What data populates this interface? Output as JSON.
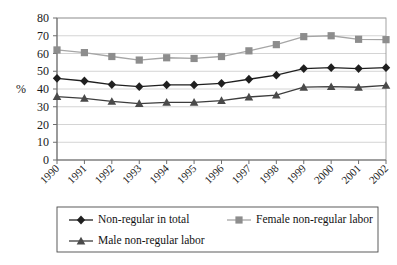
{
  "chart_data": {
    "type": "line",
    "title": "",
    "xlabel": "",
    "ylabel": "%",
    "categories": [
      "1990",
      "1991",
      "1992",
      "1993",
      "1994",
      "1995",
      "1996",
      "1997",
      "1998",
      "1999",
      "2000",
      "2001",
      "2002"
    ],
    "ylim": [
      0,
      80
    ],
    "ytick_step": 10,
    "yticks": [
      0,
      10,
      20,
      30,
      40,
      50,
      60,
      70,
      80
    ],
    "grid": true,
    "legend_position": "bottom",
    "series": [
      {
        "name": "Non-regular in total",
        "marker": "diamond",
        "color": "#1f1f1f",
        "line_color": "#1f1f1f",
        "values": [
          46.0,
          44.5,
          42.5,
          41.3,
          42.3,
          42.3,
          43.2,
          45.5,
          47.8,
          51.5,
          52.0,
          51.5,
          52.0
        ]
      },
      {
        "name": "Female non-regular labor",
        "marker": "square",
        "color": "#8d8d8d",
        "line_color": "#a6a6a6",
        "values": [
          62.0,
          60.5,
          58.3,
          56.3,
          57.6,
          57.2,
          58.3,
          61.5,
          65.0,
          69.5,
          70.0,
          68.0,
          67.8
        ]
      },
      {
        "name": "Male non-regular labor",
        "marker": "triangle",
        "color": "#4a4a4a",
        "line_color": "#3d3d3d",
        "values": [
          35.7,
          34.7,
          33.0,
          31.8,
          32.5,
          32.5,
          33.5,
          35.5,
          36.5,
          41.0,
          41.3,
          41.0,
          42.0
        ]
      }
    ]
  },
  "legend": {
    "entries": [
      {
        "label": "Non-regular in total"
      },
      {
        "label": "Female non-regular labor"
      },
      {
        "label": "Male non-regular labor"
      }
    ]
  }
}
